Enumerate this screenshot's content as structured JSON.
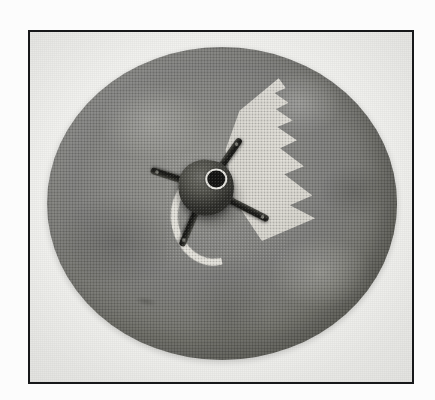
{
  "figure": {
    "domain": "Natural-Image",
    "caption": "Photographic plate of a circular friction disc fitted with a four-armed spider hub",
    "medium": "halftone-printed black-and-white photograph",
    "frame": {
      "border_color": "#17181a",
      "border_width_px": 2,
      "mat_color": "#f4f4f2",
      "x": 28,
      "y": 30,
      "width": 386,
      "height": 354
    }
  },
  "subject": {
    "name": "friction-disc-assembly",
    "label": "Circular friction disc with spider hub",
    "disc": {
      "name": "grey-disc",
      "shape": "circle",
      "center_x": 220,
      "center_y": 201,
      "diameter_px": 350,
      "surface": "mottled cast grey, worn face",
      "color_light": "#9a9a96",
      "color_mid": "#85857f",
      "color_dark": "#76766f"
    },
    "hub": {
      "name": "spider-hub",
      "label": "Four-armed spider hub",
      "arm_count": 4,
      "arm_color": "#1a1a17",
      "body_color": "#46463f",
      "center_bore": {
        "name": "center-bore",
        "label": "Central bore",
        "color": "#121210",
        "ring_color": "#efeee8"
      },
      "arms": [
        {
          "name": "arm-upper-left",
          "angle_deg": 198,
          "length_px": 58
        },
        {
          "name": "arm-upper-right",
          "angle_deg": 305,
          "length_px": 60
        },
        {
          "name": "arm-lower-right",
          "angle_deg": 27,
          "length_px": 70
        },
        {
          "name": "arm-lower-left",
          "angle_deg": 113,
          "length_px": 63
        }
      ]
    },
    "sawtooth_wedge": {
      "name": "sawtooth-wedge-aperture",
      "label": "Serrated wedge-shaped aperture",
      "tooth_count": 6,
      "color": "#e9e7e1",
      "position": "upper right of hub"
    },
    "crescent_slot": {
      "name": "crescent-slot",
      "label": "Light crescent arc slot",
      "color": "#e7e5de",
      "position": "left of hub"
    },
    "marks": [
      {
        "name": "surface-scuff-right",
        "label": "Light surface scuff",
        "position": "right of hub"
      },
      {
        "name": "surface-scuff-lower-left",
        "label": "Dark wear patch",
        "position": "lower left of disc"
      }
    ]
  },
  "palette": {
    "page_background": "#fdfdfd",
    "plate_background": "#f4f4f2",
    "frame_line": "#17181a",
    "disc_grey": "#8a8a85",
    "highlight": "#e9e7e1",
    "shadow": "#1a1a17"
  }
}
